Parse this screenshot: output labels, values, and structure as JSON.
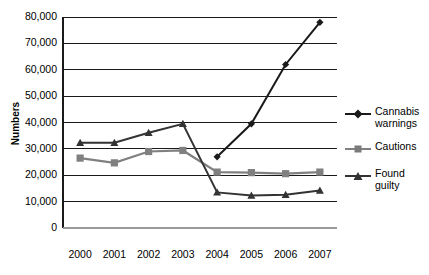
{
  "chart_data": {
    "type": "line",
    "title": "",
    "xlabel": "",
    "ylabel": "Numbers",
    "categories": [
      "2000",
      "2001",
      "2002",
      "2003",
      "2004",
      "2005",
      "2006",
      "2007"
    ],
    "ylim": [
      0,
      80000
    ],
    "yticks": [
      0,
      10000,
      20000,
      30000,
      40000,
      50000,
      60000,
      70000,
      80000
    ],
    "ytick_labels": [
      "0",
      "10,000",
      "20,000",
      "30,000",
      "40,000",
      "50,000",
      "60,000",
      "70,000",
      "80,000"
    ],
    "grid": true,
    "legend_position": "right",
    "series": [
      {
        "name": "Cannabis warnings",
        "marker": "diamond",
        "color": "#1a1a1a",
        "values": [
          null,
          null,
          null,
          null,
          27000,
          39500,
          62000,
          78000
        ]
      },
      {
        "name": "Cautions",
        "marker": "square",
        "color": "#808080",
        "values": [
          26500,
          24700,
          29000,
          29400,
          21200,
          21000,
          20600,
          21200
        ]
      },
      {
        "name": "Found guilty",
        "marker": "triangle",
        "color": "#333333",
        "values": [
          32300,
          32300,
          36100,
          39500,
          13500,
          12300,
          12600,
          14200
        ]
      }
    ]
  },
  "axis": {
    "y_label": "Numbers"
  },
  "legend": {
    "items": [
      {
        "label": "Cannabis warnings",
        "marker": "diamond-marker-icon"
      },
      {
        "label": "Cautions",
        "marker": "square-marker-icon"
      },
      {
        "label": "Found guilty",
        "marker": "triangle-marker-icon"
      }
    ]
  }
}
